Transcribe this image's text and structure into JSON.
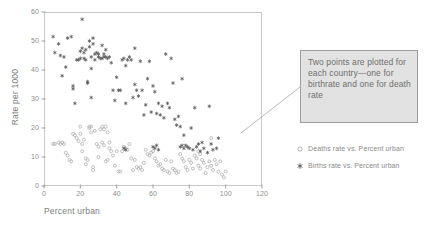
{
  "chart_data": {
    "type": "scatter",
    "title": "",
    "xlabel": "Percent urban",
    "ylabel": "Rate per 1000",
    "xlim": [
      0,
      120
    ],
    "ylim": [
      0,
      60
    ],
    "xticks": [
      0,
      20,
      40,
      60,
      80,
      100,
      120
    ],
    "yticks": [
      0,
      10,
      20,
      30,
      40,
      50,
      60
    ],
    "grid": false,
    "legend_position": "right",
    "series": [
      {
        "name": "Births rate vs. Percent urban",
        "marker": "asterisk-filled",
        "color": "#555555",
        "points": [
          [
            5,
            51.5
          ],
          [
            6,
            46.0
          ],
          [
            8,
            49.0
          ],
          [
            9,
            45.0
          ],
          [
            10,
            38.0
          ],
          [
            11,
            44.5
          ],
          [
            12,
            41.0
          ],
          [
            13,
            51.0
          ],
          [
            15,
            51.5
          ],
          [
            16,
            34.5
          ],
          [
            16,
            33.5
          ],
          [
            17,
            28.5
          ],
          [
            18,
            43.5
          ],
          [
            19,
            43.5
          ],
          [
            20,
            44.0
          ],
          [
            20,
            46.5
          ],
          [
            21,
            57.5
          ],
          [
            21,
            47.5
          ],
          [
            22,
            46.0
          ],
          [
            22,
            44.0
          ],
          [
            23,
            47.0
          ],
          [
            23,
            43.5
          ],
          [
            24,
            36.0
          ],
          [
            24,
            35.5
          ],
          [
            25,
            50.0
          ],
          [
            25,
            48.0
          ],
          [
            26,
            44.5
          ],
          [
            26,
            40.5
          ],
          [
            26,
            30.5
          ],
          [
            27,
            49.0
          ],
          [
            27,
            51.0
          ],
          [
            28,
            45.5
          ],
          [
            28,
            43.5
          ],
          [
            29,
            46.0
          ],
          [
            30,
            45.5
          ],
          [
            30,
            44.5
          ],
          [
            31,
            44.0
          ],
          [
            32,
            48.5
          ],
          [
            32,
            44.0
          ],
          [
            33,
            44.5
          ],
          [
            33,
            45.5
          ],
          [
            34,
            44.5
          ],
          [
            34,
            47.0
          ],
          [
            35,
            44.0
          ],
          [
            36,
            44.5
          ],
          [
            37,
            42.5
          ],
          [
            38,
            33.0
          ],
          [
            39,
            29.5
          ],
          [
            40,
            37.5
          ],
          [
            41,
            33.0
          ],
          [
            42,
            33.0
          ],
          [
            43,
            43.5
          ],
          [
            44,
            44.0
          ],
          [
            45,
            41.5
          ],
          [
            45,
            28.5
          ],
          [
            46,
            43.5
          ],
          [
            47,
            44.5
          ],
          [
            48,
            43.5
          ],
          [
            49,
            30.5
          ],
          [
            50,
            47.5
          ],
          [
            50,
            35.0
          ],
          [
            51,
            33.0
          ],
          [
            52,
            31.0
          ],
          [
            53,
            43.0
          ],
          [
            54,
            33.0
          ],
          [
            55,
            24.5
          ],
          [
            56,
            28.0
          ],
          [
            57,
            37.0
          ],
          [
            58,
            43.0
          ],
          [
            59,
            25.5
          ],
          [
            60,
            34.5
          ],
          [
            61,
            32.5
          ],
          [
            62,
            25.0
          ],
          [
            63,
            28.5
          ],
          [
            64,
            24.5
          ],
          [
            65,
            27.5
          ],
          [
            66,
            23.5
          ],
          [
            67,
            45.5
          ],
          [
            68,
            28.5
          ],
          [
            69,
            27.0
          ],
          [
            70,
            44.0
          ],
          [
            71,
            35.5
          ],
          [
            72,
            23.0
          ],
          [
            73,
            21.0
          ],
          [
            74,
            24.0
          ],
          [
            75,
            20.5
          ],
          [
            76,
            37.0
          ],
          [
            77,
            17.5
          ],
          [
            78,
            14.0
          ],
          [
            79,
            13.5
          ],
          [
            80,
            13.0
          ],
          [
            81,
            20.0
          ],
          [
            82,
            12.5
          ],
          [
            83,
            27.0
          ],
          [
            84,
            13.5
          ],
          [
            85,
            14.5
          ],
          [
            86,
            12.0
          ],
          [
            87,
            15.0
          ],
          [
            88,
            13.0
          ],
          [
            90,
            11.5
          ],
          [
            91,
            27.5
          ],
          [
            92,
            14.5
          ],
          [
            93,
            12.5
          ],
          [
            95,
            13.0
          ],
          [
            96,
            16.5
          ],
          [
            60,
            13.5
          ],
          [
            61,
            13.0
          ],
          [
            62,
            14.0
          ],
          [
            63,
            12.5
          ],
          [
            75,
            13.5
          ],
          [
            76,
            14.0
          ],
          [
            77,
            13.0
          ],
          [
            44,
            13.0
          ],
          [
            45,
            12.5
          ]
        ]
      },
      {
        "name": "Deaths rate vs. Percent urban",
        "marker": "circle-open",
        "color": "#a8a8a8",
        "points": [
          [
            5,
            14.5
          ],
          [
            6,
            14.5
          ],
          [
            8,
            15.0
          ],
          [
            9,
            14.5
          ],
          [
            10,
            15.0
          ],
          [
            11,
            14.5
          ],
          [
            12,
            11.5
          ],
          [
            13,
            10.5
          ],
          [
            14,
            9.0
          ],
          [
            15,
            8.5
          ],
          [
            16,
            18.0
          ],
          [
            17,
            17.5
          ],
          [
            18,
            16.5
          ],
          [
            19,
            15.5
          ],
          [
            20,
            20.5
          ],
          [
            20,
            18.0
          ],
          [
            21,
            14.5
          ],
          [
            21,
            12.0
          ],
          [
            22,
            16.0
          ],
          [
            23,
            9.5
          ],
          [
            23,
            7.5
          ],
          [
            24,
            9.0
          ],
          [
            25,
            20.5
          ],
          [
            25,
            20.0
          ],
          [
            26,
            20.5
          ],
          [
            26,
            18.5
          ],
          [
            27,
            6.5
          ],
          [
            27,
            5.5
          ],
          [
            28,
            19.0
          ],
          [
            29,
            14.5
          ],
          [
            30,
            13.5
          ],
          [
            30,
            10.0
          ],
          [
            31,
            19.5
          ],
          [
            32,
            20.5
          ],
          [
            32,
            15.0
          ],
          [
            33,
            19.5
          ],
          [
            33,
            14.0
          ],
          [
            34,
            20.5
          ],
          [
            34,
            8.5
          ],
          [
            35,
            18.5
          ],
          [
            35,
            9.0
          ],
          [
            36,
            15.0
          ],
          [
            36,
            13.0
          ],
          [
            37,
            12.0
          ],
          [
            38,
            10.5
          ],
          [
            39,
            7.0
          ],
          [
            40,
            12.0
          ],
          [
            41,
            5.0
          ],
          [
            42,
            5.0
          ],
          [
            43,
            12.0
          ],
          [
            44,
            13.5
          ],
          [
            45,
            13.0
          ],
          [
            46,
            12.5
          ],
          [
            47,
            14.5
          ],
          [
            48,
            9.5
          ],
          [
            49,
            5.5
          ],
          [
            50,
            9.0
          ],
          [
            51,
            6.5
          ],
          [
            52,
            6.0
          ],
          [
            53,
            6.5
          ],
          [
            54,
            5.5
          ],
          [
            55,
            8.0
          ],
          [
            56,
            12.5
          ],
          [
            57,
            11.0
          ],
          [
            58,
            10.5
          ],
          [
            59,
            11.5
          ],
          [
            60,
            12.0
          ],
          [
            61,
            9.5
          ],
          [
            62,
            8.5
          ],
          [
            63,
            7.0
          ],
          [
            64,
            7.5
          ],
          [
            65,
            6.0
          ],
          [
            66,
            5.5
          ],
          [
            67,
            9.0
          ],
          [
            68,
            5.0
          ],
          [
            69,
            4.5
          ],
          [
            70,
            8.5
          ],
          [
            71,
            6.0
          ],
          [
            72,
            5.5
          ],
          [
            73,
            4.5
          ],
          [
            74,
            5.0
          ],
          [
            75,
            11.0
          ],
          [
            76,
            9.5
          ],
          [
            77,
            8.5
          ],
          [
            78,
            6.5
          ],
          [
            79,
            5.5
          ],
          [
            80,
            9.0
          ],
          [
            81,
            8.0
          ],
          [
            82,
            6.0
          ],
          [
            83,
            10.5
          ],
          [
            84,
            9.5
          ],
          [
            85,
            7.0
          ],
          [
            86,
            6.0
          ],
          [
            87,
            9.0
          ],
          [
            88,
            8.0
          ],
          [
            89,
            4.5
          ],
          [
            90,
            6.5
          ],
          [
            91,
            8.5
          ],
          [
            92,
            7.0
          ],
          [
            93,
            5.5
          ],
          [
            94,
            9.0
          ],
          [
            95,
            7.5
          ],
          [
            96,
            5.0
          ],
          [
            97,
            8.5
          ],
          [
            98,
            4.0
          ],
          [
            99,
            3.0
          ],
          [
            100,
            5.0
          ],
          [
            92,
            16.5
          ],
          [
            85,
            12.0
          ],
          [
            86,
            11.0
          ]
        ]
      }
    ]
  },
  "annotation": {
    "text": "Two points are plotted for each country—one for birthrate and one for death rate",
    "leader_from": [
      300,
      87
    ],
    "leader_to": [
      241,
      133
    ],
    "fill_color": "#e2e2e2",
    "border_color": "#9d9d9d"
  },
  "legend": {
    "entries": [
      {
        "label": "Deaths rate vs. Percent urban",
        "marker": "circle-open"
      },
      {
        "label": "Births rate vs. Percent urban",
        "marker": "asterisk-filled"
      }
    ]
  },
  "axes": {
    "x_title": "Percent urban",
    "y_title": "Rate per 1000",
    "x_tick_labels": [
      "0",
      "20",
      "40",
      "60",
      "80",
      "100",
      "120"
    ],
    "y_tick_labels": [
      "0",
      "10",
      "20",
      "30",
      "40",
      "50",
      "60"
    ]
  }
}
